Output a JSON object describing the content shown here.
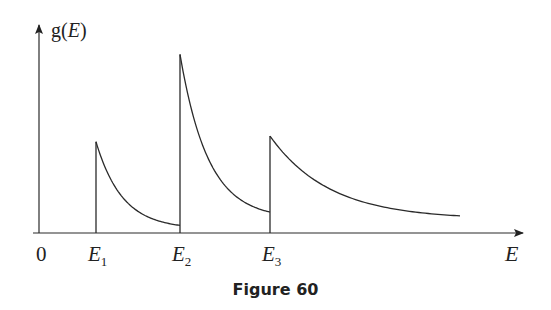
{
  "figure": {
    "caption": "Figure 60",
    "y_axis_label_main": "g(",
    "y_axis_label_var": "E",
    "y_axis_label_close": ")",
    "x_axis_label": "E",
    "origin_label": "0",
    "line_color": "#2a2a2a"
  },
  "chart_data": {
    "type": "line",
    "title": "",
    "xlabel": "E",
    "ylabel": "g(E)",
    "x_ticks": [
      {
        "label": "0",
        "sub": ""
      },
      {
        "label": "E",
        "sub": "1"
      },
      {
        "label": "E",
        "sub": "2"
      },
      {
        "label": "E",
        "sub": "3"
      }
    ],
    "xlim": [
      0,
      8
    ],
    "ylim": [
      0,
      10
    ],
    "segments": [
      {
        "name": "E1-branch",
        "x_start": 1.0,
        "x_end": 2.5,
        "peak": 4.8,
        "end_value": 0.4
      },
      {
        "name": "E2-branch",
        "x_start": 2.5,
        "x_end": 4.0,
        "peak": 9.4,
        "end_value": 1.1
      },
      {
        "name": "E3-branch",
        "x_start": 4.0,
        "x_end": 7.3,
        "peak": 5.1,
        "end_value": 0.9
      }
    ],
    "grid": false,
    "legend": "none"
  }
}
